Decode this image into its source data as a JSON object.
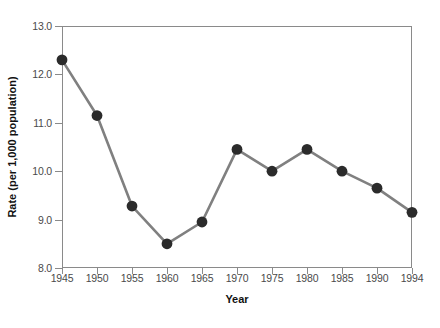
{
  "chart_data": {
    "type": "line",
    "title": "",
    "xlabel": "Year",
    "ylabel": "Rate (per 1,000 population)",
    "x": [
      1945,
      1950,
      1955,
      1960,
      1965,
      1970,
      1975,
      1980,
      1985,
      1990,
      1994
    ],
    "values": [
      12.3,
      11.15,
      9.28,
      8.5,
      8.95,
      10.45,
      10.0,
      10.45,
      10.0,
      9.65,
      9.15
    ],
    "series": [
      {
        "name": "Rate",
        "values": [
          12.3,
          11.15,
          9.28,
          8.5,
          8.95,
          10.45,
          10.0,
          10.45,
          10.0,
          9.65,
          9.15
        ]
      }
    ],
    "xtick_labels": [
      "1945",
      "1950",
      "1955",
      "1960",
      "1965",
      "1970",
      "1975",
      "1980",
      "1985",
      "1990",
      "1994"
    ],
    "ytick_labels": [
      "8.0",
      "9.0",
      "10.0",
      "11.0",
      "12.0",
      "13.0"
    ],
    "ytick_values": [
      8.0,
      9.0,
      10.0,
      11.0,
      12.0,
      13.0
    ],
    "ylim": [
      8.0,
      13.0
    ],
    "xlim": [
      1945,
      1994
    ],
    "grid": false,
    "legend": null,
    "colors": {
      "line": "#808080",
      "marker": "#2b2b2b",
      "frame": "#8a8a8a",
      "tick_text": "#4a4a4a",
      "axis_title": "#111111",
      "background": "#ffffff"
    }
  }
}
